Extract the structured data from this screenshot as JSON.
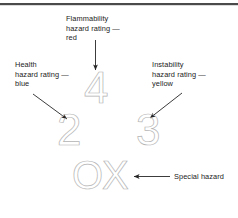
{
  "figure": {
    "title_rule": "top-rule",
    "background_color": "#ffffff",
    "glyph_outline_color": "#b4b4b4",
    "text_color": "#1b1b1b",
    "arrow_color": "#262626"
  },
  "diagram": {
    "name": "nfpa-704-fire-diamond-callout",
    "labels": {
      "flammability": {
        "line1": "Flammability",
        "line2": "hazard rating —",
        "line3": "red",
        "color_word": "red"
      },
      "health": {
        "line1": "Health",
        "line2": "hazard rating —",
        "line3": "blue",
        "color_word": "blue"
      },
      "instability": {
        "line1": "Instability",
        "line2": "hazard rating —",
        "line3": "yellow",
        "color_word": "yellow"
      },
      "special": {
        "line1": "Special hazard"
      }
    },
    "ratings": {
      "flammability_value": "4",
      "health_value": "2",
      "instability_value": "3",
      "special_value": "OX"
    }
  }
}
